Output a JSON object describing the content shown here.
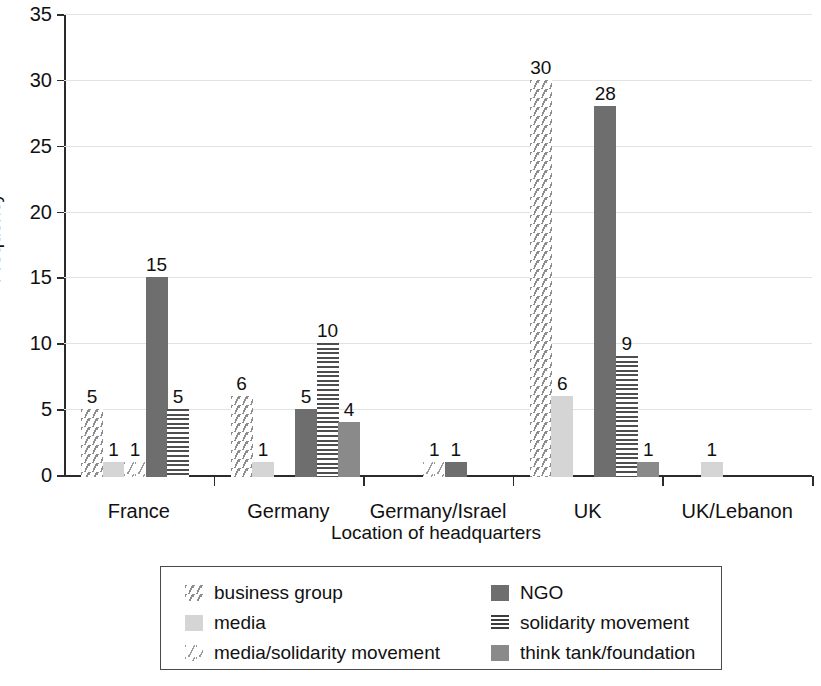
{
  "chart_data": {
    "type": "bar",
    "title": "",
    "xlabel": "Location of headquarters",
    "ylabel": "Frequency",
    "ylim": [
      0,
      35
    ],
    "yticks": [
      "0",
      "5",
      "10",
      "15",
      "20",
      "25",
      "30",
      "35"
    ],
    "grid": true,
    "legend_position": "bottom",
    "categories": [
      "France",
      "Germany",
      "Germany/Israel",
      "UK",
      "UK/Lebanon"
    ],
    "series": [
      {
        "name": "business group",
        "values": [
          5,
          6,
          0,
          30,
          0
        ]
      },
      {
        "name": "media",
        "values": [
          1,
          1,
          0,
          6,
          1
        ]
      },
      {
        "name": "media/solidarity movement",
        "values": [
          1,
          0,
          1,
          0,
          0
        ]
      },
      {
        "name": "NGO",
        "values": [
          15,
          5,
          1,
          28,
          0
        ]
      },
      {
        "name": "solidarity movement",
        "values": [
          5,
          10,
          0,
          9,
          0
        ]
      },
      {
        "name": "think tank/foundation",
        "values": [
          0,
          4,
          0,
          1,
          0
        ]
      }
    ],
    "bars": [
      {
        "category": "France",
        "series": "business group",
        "value": 5,
        "label": "5"
      },
      {
        "category": "France",
        "series": "media",
        "value": 1,
        "label": "1"
      },
      {
        "category": "France",
        "series": "media/solidarity movement",
        "value": 1,
        "label": "1"
      },
      {
        "category": "France",
        "series": "NGO",
        "value": 15,
        "label": "15"
      },
      {
        "category": "France",
        "series": "solidarity movement",
        "value": 5,
        "label": "5"
      },
      {
        "category": "Germany",
        "series": "business group",
        "value": 6,
        "label": "6"
      },
      {
        "category": "Germany",
        "series": "media",
        "value": 1,
        "label": "1"
      },
      {
        "category": "Germany",
        "series": "NGO",
        "value": 5,
        "label": "5"
      },
      {
        "category": "Germany",
        "series": "solidarity movement",
        "value": 10,
        "label": "10"
      },
      {
        "category": "Germany",
        "series": "think tank/foundation",
        "value": 4,
        "label": "4"
      },
      {
        "category": "Germany/Israel",
        "series": "media/solidarity movement",
        "value": 1,
        "label": "1"
      },
      {
        "category": "Germany/Israel",
        "series": "NGO",
        "value": 1,
        "label": "1"
      },
      {
        "category": "UK",
        "series": "business group",
        "value": 30,
        "label": "30"
      },
      {
        "category": "UK",
        "series": "media",
        "value": 6,
        "label": "6"
      },
      {
        "category": "UK",
        "series": "NGO",
        "value": 28,
        "label": "28"
      },
      {
        "category": "UK",
        "series": "solidarity movement",
        "value": 9,
        "label": "9"
      },
      {
        "category": "UK",
        "series": "think tank/foundation",
        "value": 1,
        "label": "1"
      },
      {
        "category": "UK/Lebanon",
        "series": "media",
        "value": 1,
        "label": "1"
      }
    ]
  },
  "axis": {
    "y_label": "Frequency",
    "x_label": "Location of headquarters",
    "y_ticks": [
      "35",
      "30",
      "25",
      "20",
      "15",
      "10",
      "5",
      "0"
    ],
    "x_categories": [
      "France",
      "Germany",
      "Germany/Israel",
      "UK",
      "UK/Lebanon"
    ]
  },
  "legend": {
    "left_column": [
      {
        "label": "business group",
        "pattern": "sparse-diagonal-dashes",
        "color": "#8d8d8d"
      },
      {
        "label": "media",
        "pattern": "solid-light-gray",
        "color": "#d5d5d5"
      },
      {
        "label": "media/solidarity movement",
        "pattern": "very-sparse-dashes",
        "color": "#9a9a9a"
      }
    ],
    "right_column": [
      {
        "label": "NGO",
        "pattern": "solid-dark-gray",
        "color": "#6e6e6e"
      },
      {
        "label": "solidarity movement",
        "pattern": "horizontal-lines",
        "color": "#4d4d4d"
      },
      {
        "label": "think tank/foundation",
        "pattern": "solid-mid-gray",
        "color": "#8a8a8a"
      }
    ]
  },
  "values": {
    "france": {
      "business": "5",
      "media": "1",
      "media_sol": "1",
      "ngo": "15",
      "solidarity": "5"
    },
    "germany": {
      "business": "6",
      "media": "1",
      "ngo": "5",
      "solidarity": "10",
      "thinktank": "4"
    },
    "germany_israel": {
      "media_sol": "1",
      "ngo": "1"
    },
    "uk": {
      "business": "30",
      "media": "6",
      "ngo": "28",
      "solidarity": "9",
      "thinktank": "1"
    },
    "uk_lebanon": {
      "media": "1"
    }
  }
}
